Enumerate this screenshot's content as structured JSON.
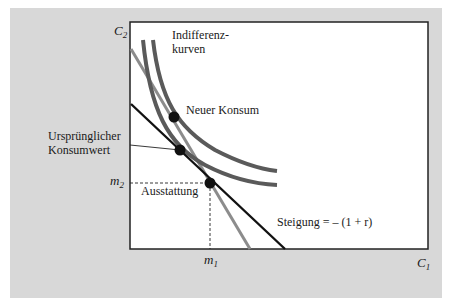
{
  "figure": {
    "axes": {
      "y_label": "C",
      "y_label_sub": "2",
      "x_label": "C",
      "x_label_sub": "1"
    },
    "ticks": {
      "m2": "m",
      "m2_sub": "2",
      "m1": "m",
      "m1_sub": "1"
    },
    "labels": {
      "indifference_line1": "Indifferenz-",
      "indifference_line2": "kurven",
      "new_consumption": "Neuer Konsum",
      "original_line1": "Ursprünglicher",
      "original_line2": "Konsumwert",
      "endowment": "Ausstattung",
      "slope": "Steigung = – (1 + r)"
    },
    "colors": {
      "panel": "#d8d8d8",
      "plot_bg": "#ffffff",
      "budget_line": "#111111",
      "new_budget_line": "#8c8c8c",
      "indifference_curve": "#5a5a5a",
      "point": "#111111"
    }
  }
}
